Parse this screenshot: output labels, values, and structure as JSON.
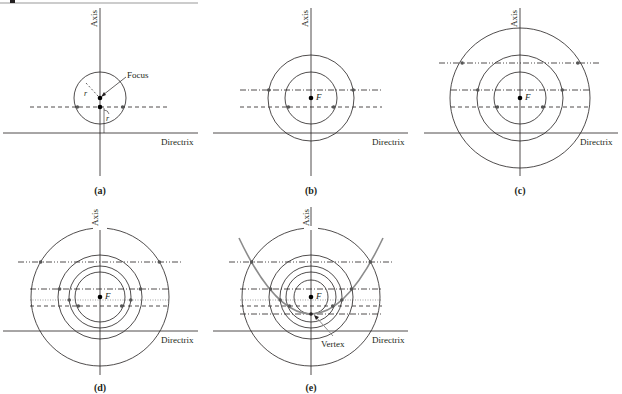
{
  "figure": {
    "top_rule": {
      "x1": 0,
      "x2": 198,
      "y": 3,
      "color": "#9a9a9a"
    },
    "colors": {
      "line": "#231f20",
      "point": "#555555",
      "parabola": "#8c8c8c",
      "focus": "#000000"
    },
    "labels": {
      "axis": "Axis",
      "directrix": "Directrix",
      "focus_word": "Focus",
      "focus_symbol": "F",
      "radius": "r",
      "vertex": "Vertex"
    },
    "panels": [
      {
        "id": "a",
        "caption": "(a)",
        "axis_x": 100,
        "focus_y": 98,
        "directrix_y": 133,
        "caption_y": 193
      },
      {
        "id": "b",
        "caption": "(b)",
        "axis_x": 311,
        "focus_y": 98,
        "directrix_y": 133,
        "caption_y": 193
      },
      {
        "id": "c",
        "caption": "(c)",
        "axis_x": 520,
        "focus_y": 98,
        "directrix_y": 133,
        "caption_y": 193
      },
      {
        "id": "d",
        "caption": "(d)",
        "axis_x": 100,
        "focus_y": 297,
        "directrix_y": 331,
        "caption_y": 391
      },
      {
        "id": "e",
        "caption": "(e)",
        "axis_x": 311,
        "focus_y": 297,
        "directrix_y": 331,
        "caption_y": 391
      }
    ]
  }
}
